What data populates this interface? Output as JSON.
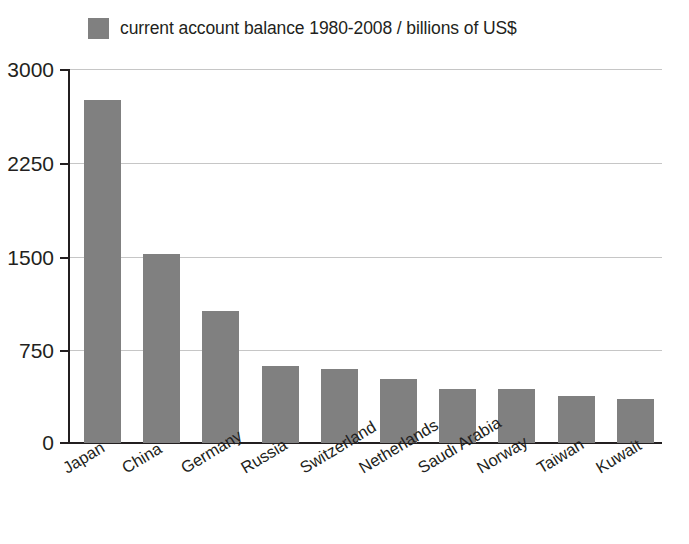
{
  "legend": {
    "swatch_color": "#808080",
    "label": "current account balance 1980-2008 / billions of US$"
  },
  "axis": {
    "y_ticks": [
      "3000",
      "2250",
      "1500",
      "750",
      "0"
    ]
  },
  "chart_data": {
    "type": "bar",
    "title": "",
    "subtitle": "",
    "xlabel": "",
    "ylabel": "",
    "ylim": [
      0,
      3000
    ],
    "yticks": [
      0,
      750,
      1500,
      2250,
      3000
    ],
    "grid": true,
    "legend_position": "top-left",
    "bar_color": "#808080",
    "series_name": "current account balance 1980-2008 / billions of US$",
    "units": "billions of US$",
    "categories": [
      "Japan",
      "China",
      "Germany",
      "Russia",
      "Switzerland",
      "Netherlands",
      "Saudi Arabia",
      "Norway",
      "Taiwan",
      "Kuwait"
    ],
    "values": [
      2750,
      1520,
      1055,
      620,
      595,
      515,
      435,
      435,
      378,
      355
    ]
  }
}
